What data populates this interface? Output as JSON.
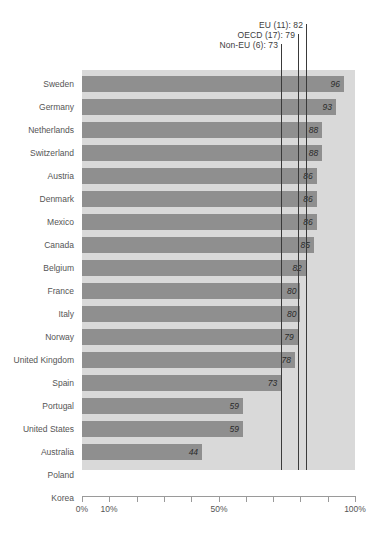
{
  "chart_data": {
    "type": "bar",
    "orientation": "horizontal",
    "title": "",
    "xlabel": "",
    "ylabel": "",
    "xlim": [
      0,
      100
    ],
    "grid": false,
    "legend_position": "none",
    "value_suffix": "%",
    "categories": [
      "Sweden",
      "Germany",
      "Netherlands",
      "Switzerland",
      "Austria",
      "Denmark",
      "Mexico",
      "Canada",
      "Belgium",
      "France",
      "Italy",
      "Norway",
      "United Kingdom",
      "Spain",
      "Portugal",
      "United States",
      "Australia",
      "Poland",
      "Korea"
    ],
    "values": [
      96,
      93,
      88,
      88,
      86,
      86,
      86,
      85,
      82,
      80,
      80,
      79,
      78,
      73,
      59,
      59,
      44,
      null,
      null
    ],
    "value_labels": [
      "96",
      "93",
      "88",
      "88",
      "86",
      "86",
      "86",
      "85",
      "82",
      "80",
      "80",
      "79",
      "78",
      "73",
      "59",
      "59",
      "44",
      "…",
      "…"
    ],
    "missing_marker": "…",
    "bars": [
      {
        "label": "Sweden",
        "value": 96,
        "display": "96"
      },
      {
        "label": "Germany",
        "value": 93,
        "display": "93"
      },
      {
        "label": "Netherlands",
        "value": 88,
        "display": "88"
      },
      {
        "label": "Switzerland",
        "value": 88,
        "display": "88"
      },
      {
        "label": "Austria",
        "value": 86,
        "display": "86"
      },
      {
        "label": "Denmark",
        "value": 86,
        "display": "86"
      },
      {
        "label": "Mexico",
        "value": 86,
        "display": "86"
      },
      {
        "label": "Canada",
        "value": 85,
        "display": "85"
      },
      {
        "label": "Belgium",
        "value": 82,
        "display": "82"
      },
      {
        "label": "France",
        "value": 80,
        "display": "80"
      },
      {
        "label": "Italy",
        "value": 80,
        "display": "80"
      },
      {
        "label": "Norway",
        "value": 79,
        "display": "79"
      },
      {
        "label": "United Kingdom",
        "value": 78,
        "display": "78"
      },
      {
        "label": "Spain",
        "value": 73,
        "display": "73"
      },
      {
        "label": "Portugal",
        "value": 59,
        "display": "59"
      },
      {
        "label": "United States",
        "value": 59,
        "display": "59"
      },
      {
        "label": "Australia",
        "value": 44,
        "display": "44"
      },
      {
        "label": "Poland",
        "value": null,
        "display": "…"
      },
      {
        "label": "Korea",
        "value": null,
        "display": "…"
      }
    ],
    "reference_lines": [
      {
        "name": "Non-EU (6)",
        "value": 73,
        "label": "Non-EU (6): 73"
      },
      {
        "name": "OECD (17)",
        "value": 79,
        "label": "OECD (17): 79"
      },
      {
        "name": "EU (11)",
        "value": 82,
        "label": "EU (11): 82"
      }
    ],
    "xticks": [
      0,
      10,
      20,
      30,
      40,
      50,
      60,
      70,
      80,
      90,
      100
    ],
    "xticklabels": [
      "0%",
      "10%",
      "",
      "",
      "",
      "50%",
      "",
      "",
      "",
      "",
      "100%"
    ],
    "colors": {
      "bar": "#8f8f8f",
      "plot_background": "#d9d9d9",
      "reference_line": "#3a3a3a",
      "value_label": "#2b2b2b",
      "category_label": "#555555",
      "axis": "#9a9a9a",
      "page_background": "#ffffff"
    }
  }
}
